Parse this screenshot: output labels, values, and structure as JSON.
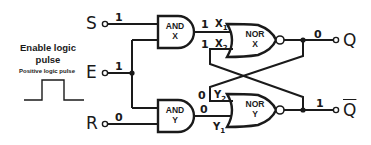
{
  "diagram": {
    "inputs": {
      "S": {
        "label": "S",
        "value": "1"
      },
      "E": {
        "label": "E",
        "value": "1"
      },
      "R": {
        "label": "R",
        "value": "0"
      }
    },
    "outputs": {
      "Q": {
        "label": "Q",
        "value": "0"
      },
      "Qbar": {
        "label": "Q",
        "value": "1",
        "overline": true
      }
    },
    "gates": {
      "and_x": {
        "type": "AND",
        "name": "X",
        "line1": "AND",
        "line2": "X"
      },
      "and_y": {
        "type": "AND",
        "name": "Y",
        "line1": "AND",
        "line2": "Y"
      },
      "nor_x": {
        "type": "NOR",
        "name": "X",
        "line1": "NOR",
        "line2": "X"
      },
      "nor_y": {
        "type": "NOR",
        "name": "Y",
        "line1": "NOR",
        "line2": "Y"
      }
    },
    "signals": {
      "x1": {
        "name": "X",
        "sub": "1",
        "value": "1"
      },
      "x2": {
        "name": "X",
        "sub": "2",
        "value": "1"
      },
      "y2": {
        "name": "Y",
        "sub": "2",
        "value": "0"
      },
      "y1": {
        "name": "Y",
        "sub": "1",
        "value": "0"
      }
    },
    "side_note": {
      "heading_line1": "Enable logic",
      "heading_line2": "pulse",
      "subheading": "Positive logic pulse",
      "waveform": "positive-pulse"
    },
    "colors": {
      "ink": "#1a1a1a",
      "background": "#ffffff"
    }
  }
}
